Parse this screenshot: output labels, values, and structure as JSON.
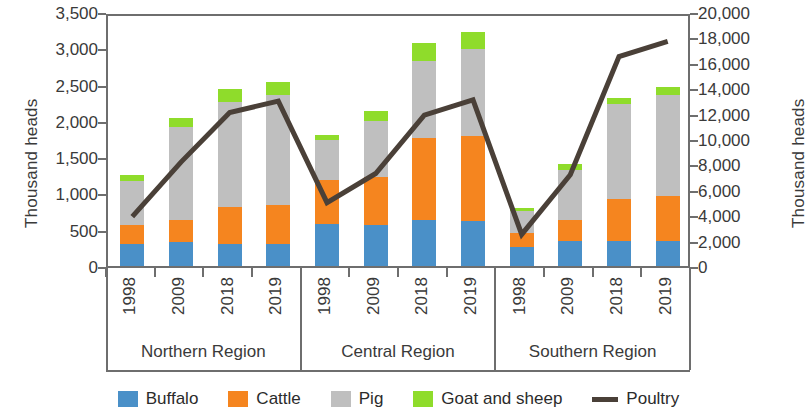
{
  "axes": {
    "left_title": "Thousand heads",
    "right_title": "Thousand heads",
    "left_ticks": [
      "0",
      "500",
      "1,000",
      "1,500",
      "2,000",
      "2,500",
      "3,000",
      "3,500"
    ],
    "right_ticks": [
      "0",
      "2,000",
      "4,000",
      "6,000",
      "8,000",
      "10,000",
      "12,000",
      "14,000",
      "16,000",
      "18,000",
      "20,000"
    ]
  },
  "legend": {
    "items": [
      {
        "label": "Buffalo",
        "color": "#4a90c8",
        "marker": "square"
      },
      {
        "label": "Cattle",
        "color": "#f5851f",
        "marker": "square"
      },
      {
        "label": "Pig",
        "color": "#bfbfbf",
        "marker": "square"
      },
      {
        "label": "Goat and sheep",
        "color": "#8fdc2b",
        "marker": "square"
      },
      {
        "label": "Poultry",
        "color": "#4a4038",
        "marker": "line"
      }
    ]
  },
  "regions": [
    {
      "name": "Northern Region",
      "years": [
        "1998",
        "2009",
        "2018",
        "2019"
      ]
    },
    {
      "name": "Central Region",
      "years": [
        "1998",
        "2009",
        "2018",
        "2019"
      ]
    },
    {
      "name": "Southern Region",
      "years": [
        "1998",
        "2009",
        "2018",
        "2019"
      ]
    }
  ],
  "chart_data": {
    "type": "bar",
    "subtype": "stacked-bar-with-line-overlay",
    "title": "",
    "xlabel": "",
    "ylabel": "Thousand heads",
    "y2label": "Thousand heads",
    "ylim": [
      0,
      3500
    ],
    "y2lim": [
      0,
      20000
    ],
    "ytick_step": 500,
    "y2tick_step": 2000,
    "grid": false,
    "legend_position": "bottom",
    "categories": [
      "Northern Region 1998",
      "Northern Region 2009",
      "Northern Region 2018",
      "Northern Region 2019",
      "Central Region 1998",
      "Central Region 2009",
      "Central Region 2018",
      "Central Region 2019",
      "Southern Region 1998",
      "Southern Region 2009",
      "Southern Region 2018",
      "Southern Region 2019"
    ],
    "series": [
      {
        "name": "Buffalo",
        "axis": "left",
        "color": "#4a90c8",
        "values": [
          310,
          330,
          300,
          310,
          580,
          570,
          630,
          620,
          260,
          340,
          350,
          350
        ]
      },
      {
        "name": "Cattle",
        "axis": "left",
        "color": "#f5851f",
        "values": [
          250,
          310,
          520,
          530,
          610,
          660,
          1140,
          1170,
          200,
          290,
          580,
          610
        ]
      },
      {
        "name": "Pig",
        "axis": "left",
        "color": "#bfbfbf",
        "values": [
          610,
          1280,
          1440,
          1520,
          540,
          770,
          1060,
          1200,
          300,
          690,
          1300,
          1400
        ]
      },
      {
        "name": "Goat and sheep",
        "axis": "left",
        "color": "#8fdc2b",
        "values": [
          80,
          120,
          180,
          170,
          80,
          140,
          240,
          240,
          40,
          80,
          90,
          100
        ]
      },
      {
        "name": "Poultry",
        "axis": "right",
        "color": "#4a4038",
        "values": [
          4200,
          8500,
          12400,
          13300,
          5300,
          7600,
          12200,
          13400,
          2800,
          7500,
          16800,
          18000
        ]
      }
    ],
    "stack_totals": [
      1250,
      2040,
      2440,
      2530,
      1810,
      2140,
      3070,
      3230,
      800,
      1400,
      2320,
      2460
    ]
  }
}
